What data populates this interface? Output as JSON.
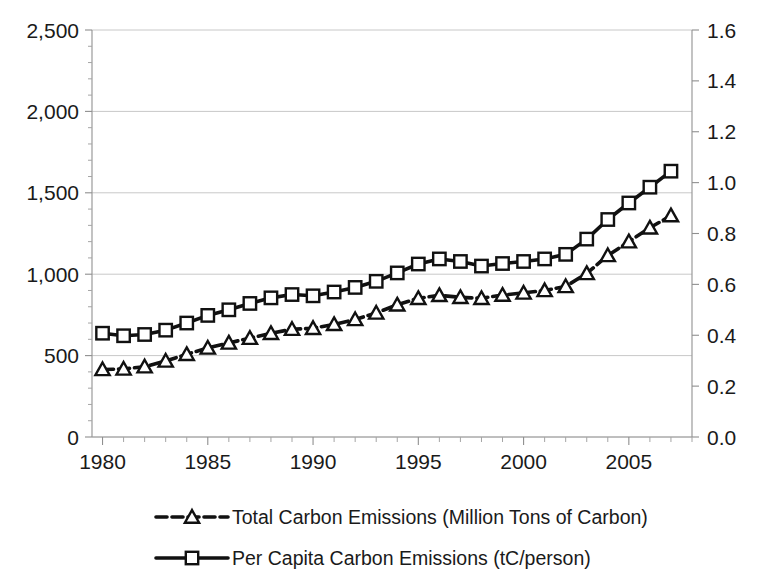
{
  "chart_data": {
    "type": "line",
    "title": "",
    "subtitle": "",
    "xlabel": "",
    "ylabel": "",
    "grid": true,
    "legend_position": "bottom",
    "x": [
      1980,
      1981,
      1982,
      1983,
      1984,
      1985,
      1986,
      1987,
      1988,
      1989,
      1990,
      1991,
      1992,
      1993,
      1994,
      1995,
      1996,
      1997,
      1998,
      1999,
      2000,
      2001,
      2002,
      2003,
      2004,
      2005,
      2006,
      2007
    ],
    "xlim": [
      1979.5,
      2008
    ],
    "xticks": [
      1980,
      1985,
      1990,
      1995,
      2000,
      2005
    ],
    "xticklabels": [
      "1980",
      "1985",
      "1990",
      "1995",
      "2000",
      "2005"
    ],
    "axes": [
      {
        "id": "left",
        "name": "Total Carbon Emissions (Million Tons of Carbon)",
        "lim": [
          0,
          2500
        ],
        "ticks": [
          0,
          500,
          1000,
          1500,
          2000,
          2500
        ],
        "ticklabels": [
          "0",
          "500",
          "1,000",
          "1,500",
          "2,000",
          "2,500"
        ]
      },
      {
        "id": "right",
        "name": "Per Capita Carbon Emissions (tC/person)",
        "lim": [
          0.0,
          1.6
        ],
        "ticks": [
          0.0,
          0.2,
          0.4,
          0.6,
          0.8,
          1.0,
          1.2,
          1.4,
          1.6
        ],
        "ticklabels": [
          "0.0",
          "0.2",
          "0.4",
          "0.6",
          "0.8",
          "1.0",
          "1.2",
          "1.4",
          "1.6"
        ]
      }
    ],
    "series": [
      {
        "name": "Total Carbon Emissions (Million Tons of Carbon)",
        "axis": "left",
        "marker": "triangle",
        "linestyle": "dashed",
        "color": "#111111",
        "unit": "Million Tons of Carbon",
        "values": [
          415,
          418,
          432,
          467,
          508,
          547,
          578,
          607,
          637,
          662,
          668,
          692,
          722,
          762,
          812,
          852,
          870,
          858,
          852,
          872,
          885,
          900,
          925,
          1005,
          1115,
          1200,
          1285,
          1360
        ]
      },
      {
        "name": "Per Capita Carbon Emissions (tC/person)",
        "axis": "right",
        "marker": "square",
        "linestyle": "solid",
        "color": "#111111",
        "unit": "tC/person",
        "values": [
          0.408,
          0.398,
          0.403,
          0.42,
          0.448,
          0.478,
          0.5,
          0.525,
          0.547,
          0.56,
          0.555,
          0.57,
          0.588,
          0.612,
          0.645,
          0.68,
          0.7,
          0.69,
          0.672,
          0.682,
          0.69,
          0.7,
          0.718,
          0.778,
          0.855,
          0.92,
          0.982,
          1.045
        ]
      }
    ],
    "legend": [
      {
        "label": "Total Carbon Emissions (Million Tons of Carbon)",
        "marker": "triangle",
        "linestyle": "dashed"
      },
      {
        "label": "Per Capita Carbon Emissions (tC/person)",
        "marker": "square",
        "linestyle": "solid"
      }
    ]
  }
}
